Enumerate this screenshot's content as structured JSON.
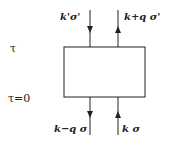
{
  "diagram": {
    "time_labels": {
      "top": "τ",
      "bottom": "τ=0"
    },
    "legs": {
      "top_left": "k'σ'",
      "top_right": "k+q σ'",
      "bottom_left": "k−q σ",
      "bottom_right": "k σ"
    },
    "colors": {
      "line": "#222222",
      "background": "#ffffff"
    }
  }
}
